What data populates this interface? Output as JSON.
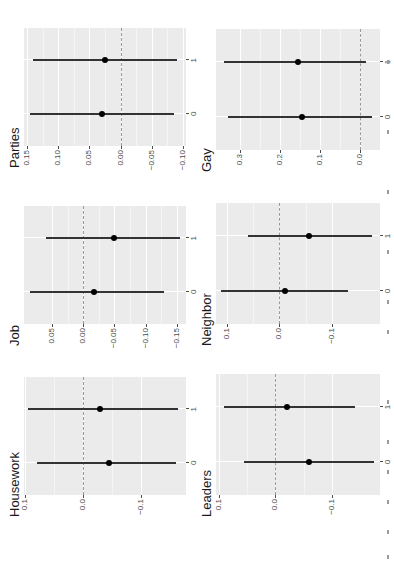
{
  "figure": {
    "layout": "2 columns x 3 rows of rotated coefficient plots",
    "colors": {
      "panel_bg": "#ebebeb",
      "grid": "#ffffff",
      "ci_line": "#333333",
      "point": "#000000",
      "zero_line": "#9a9a9a",
      "text": "#1a1a1a"
    }
  },
  "chart_data": [
    {
      "type": "scatter",
      "title": "Parties",
      "xlabel": "",
      "ylabel": "",
      "categories": [
        "0",
        "1"
      ],
      "estimates": [
        0.03,
        0.025
      ],
      "ci_low": [
        -0.085,
        -0.09
      ],
      "ci_high": [
        0.145,
        0.14
      ],
      "yticks": [
        0.15,
        0.1,
        0.05,
        0.0,
        -0.05,
        -0.1
      ],
      "ytick_labels": [
        "0.15",
        "0.10",
        "0.05",
        "0.00",
        "−0.05",
        "−0.10"
      ],
      "ylim": [
        -0.105,
        0.155
      ],
      "reference_line": 0,
      "grid": true
    },
    {
      "type": "scatter",
      "title": "Job",
      "xlabel": "",
      "ylabel": "",
      "categories": [
        "0",
        "1"
      ],
      "estimates": [
        -0.018,
        -0.05
      ],
      "ci_low": [
        -0.13,
        -0.155
      ],
      "ci_high": [
        0.085,
        0.06
      ],
      "yticks": [
        0.05,
        0.0,
        -0.05,
        -0.1,
        -0.15
      ],
      "ytick_labels": [
        "0.05",
        "0.00",
        "−0.05",
        "−0.10",
        "−0.15"
      ],
      "ylim": [
        -0.165,
        0.095
      ],
      "reference_line": 0,
      "grid": true
    },
    {
      "type": "scatter",
      "title": "Housework",
      "xlabel": "",
      "ylabel": "",
      "categories": [
        "0",
        "1"
      ],
      "estimates": [
        -0.045,
        -0.03
      ],
      "ci_low": [
        -0.16,
        -0.165
      ],
      "ci_high": [
        0.08,
        0.095
      ],
      "yticks": [
        0.1,
        0.0,
        -0.1
      ],
      "ytick_labels": [
        "0.1",
        "0.0",
        "−0.1"
      ],
      "ylim": [
        -0.178,
        0.102
      ],
      "reference_line": 0,
      "grid": true
    },
    {
      "type": "scatter",
      "title": "Gay",
      "xlabel": "",
      "ylabel": "",
      "categories": [
        "0",
        "1"
      ],
      "estimates": [
        0.145,
        0.155
      ],
      "ci_low": [
        -0.03,
        -0.015
      ],
      "ci_high": [
        0.33,
        0.34
      ],
      "yticks": [
        0.3,
        0.2,
        0.1,
        0.0
      ],
      "ytick_labels": [
        "0.3",
        "0.2",
        "0.1",
        "0.0"
      ],
      "ylim": [
        -0.05,
        0.36
      ],
      "reference_line": 0,
      "grid": true
    },
    {
      "type": "scatter",
      "title": "Neighbor",
      "xlabel": "",
      "ylabel": "",
      "categories": [
        "0",
        "1"
      ],
      "estimates": [
        -0.01,
        -0.055
      ],
      "ci_low": [
        -0.13,
        -0.175
      ],
      "ci_high": [
        0.11,
        0.06
      ],
      "yticks": [
        0.1,
        0.0,
        -0.1
      ],
      "ytick_labels": [
        "0.1",
        "0.0",
        "−0.1"
      ],
      "ylim": [
        -0.19,
        0.12
      ],
      "reference_line": 0,
      "grid": true
    },
    {
      "type": "scatter",
      "title": "Leaders",
      "xlabel": "",
      "ylabel": "",
      "categories": [
        "0",
        "1"
      ],
      "estimates": [
        -0.06,
        -0.02
      ],
      "ci_low": [
        -0.175,
        -0.14
      ],
      "ci_high": [
        0.055,
        0.09
      ],
      "yticks": [
        0.1,
        0.0,
        -0.1
      ],
      "ytick_labels": [
        "0.1",
        "0.0",
        "−0.1"
      ],
      "ylim": [
        -0.185,
        0.105
      ],
      "reference_line": 0,
      "grid": true
    }
  ]
}
